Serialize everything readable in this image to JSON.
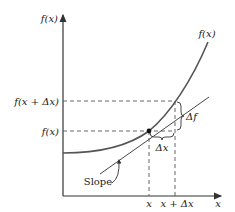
{
  "diagram": {
    "y_axis_label": "f(x)",
    "x_axis_label": "x",
    "curve_label": "f(x)",
    "level_labels": {
      "upper": "f(x + Δx)",
      "lower": "f(x)"
    },
    "tick_labels": {
      "x": "x",
      "x_plus_dx": "x + Δx"
    },
    "delta_x_label": "Δx",
    "delta_f_label": "Δf",
    "slope_label": "Slope",
    "colors": {
      "curve": "#555555",
      "axes": "#333333",
      "dashed": "#555555",
      "text": "#1a1a1a"
    }
  }
}
